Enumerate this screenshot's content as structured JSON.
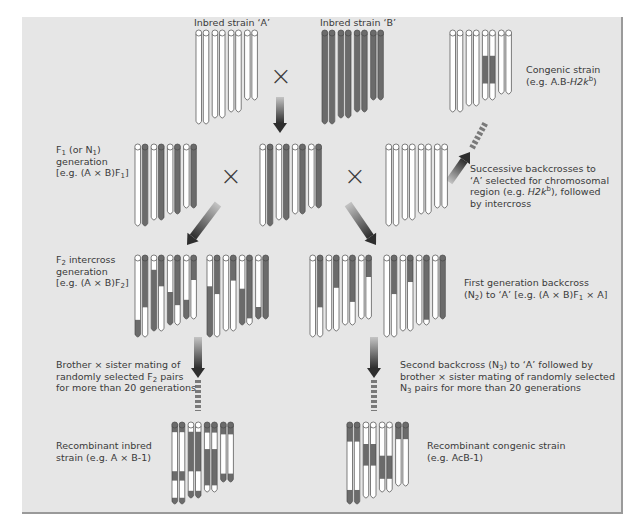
{
  "colors": {
    "panel_bg": "#e6e6e6",
    "panel_border": "#9a9a9a",
    "chrom_A": "#ffffff",
    "chrom_B": "#6b6b6b",
    "outline": "#4a4a4a",
    "text": "#3a3a3a"
  },
  "labels": {
    "inbred_a": "Inbred strain ‘A’",
    "inbred_b": "Inbred strain ‘B’",
    "congenic_line1": "Congenic strain",
    "congenic_line2_pre": "(e.g. A.B-",
    "congenic_line2_gene": "H2k",
    "congenic_line2_sup": "b",
    "congenic_line2_post": ")",
    "f1_line1_pre": "F",
    "f1_line1_sub": "1",
    "f1_line1_mid": " (or N",
    "f1_line1_sub2": "1",
    "f1_line1_post": ")",
    "f1_line2": "generation",
    "f1_line3_pre": "[e.g. (A × B)F",
    "f1_line3_sub": "1",
    "f1_line3_post": "]",
    "successive_line1": "Successive backcrosses to",
    "successive_line2": "‘A’ selected for chromosomal",
    "successive_line3_pre": "region (e.g. ",
    "successive_line3_gene": "H2k",
    "successive_line3_sup": "b",
    "successive_line3_post": "), followed",
    "successive_line4": "by intercross",
    "f2_line1_pre": "F",
    "f2_line1_sub": "2",
    "f2_line1_post": " intercross",
    "f2_line2": "generation",
    "f2_line3_pre": "[e.g. (A × B)F",
    "f2_line3_sub": "2",
    "f2_line3_post": "]",
    "backcross_line1": "First generation backcross",
    "backcross_line2_pre": "(N",
    "backcross_line2_sub": "2",
    "backcross_line2_mid": ") to ‘A’ [e.g. (A × B)F",
    "backcross_line2_sub2": "1",
    "backcross_line2_post": " × A]",
    "bs_left_line1": "Brother × sister mating of",
    "bs_left_line2_pre": "randomly selected F",
    "bs_left_line2_sub": "2",
    "bs_left_line2_post": " pairs",
    "bs_left_line3": "for more than 20 generations",
    "bs_right_line1": "Second backcross (N",
    "bs_right_line1_sub": "3",
    "bs_right_line1_post": ") to ‘A’ followed by",
    "bs_right_line2": "brother × sister mating of randomly selected",
    "bs_right_line3_pre": "N",
    "bs_right_line3_sub": "3",
    "bs_right_line3_post": " pairs for more than 20 generations",
    "ri_line1": "Recombinant inbred",
    "ri_line2": "strain (e.g. A × B-1)",
    "rc_line1": "Recombinant congenic strain",
    "rc_line2": "(e.g. AcB-1)",
    "cross_symbol": "×"
  },
  "chromosome_groups": [
    {
      "name": "inbred-strain-a",
      "x0": 196,
      "top": 31,
      "lengths": [
        90,
        90,
        84,
        84,
        78,
        78,
        66,
        66
      ],
      "segments": [
        [
          "A"
        ],
        [
          "A"
        ],
        [
          "A"
        ],
        [
          "A"
        ],
        [
          "A"
        ],
        [
          "A"
        ],
        [
          "A"
        ],
        [
          "A"
        ]
      ]
    },
    {
      "name": "inbred-strain-b",
      "x0": 322,
      "top": 31,
      "lengths": [
        90,
        90,
        84,
        84,
        78,
        78,
        66,
        66
      ],
      "segments": [
        [
          "B"
        ],
        [
          "B"
        ],
        [
          "B"
        ],
        [
          "B"
        ],
        [
          "B"
        ],
        [
          "B"
        ],
        [
          "B"
        ],
        [
          "B"
        ]
      ]
    },
    {
      "name": "congenic-strain",
      "x0": 450,
      "top": 31,
      "lengths": [
        78,
        78,
        72,
        72,
        66,
        66,
        60,
        60
      ],
      "segments": [
        [
          "A"
        ],
        [
          "A"
        ],
        [
          "A"
        ],
        [
          "A"
        ],
        [
          [
            "A",
            0.33
          ],
          [
            "B",
            0.42
          ],
          [
            "A",
            0.25
          ]
        ],
        [
          [
            "A",
            0.33
          ],
          [
            "B",
            0.42
          ],
          [
            "A",
            0.25
          ]
        ],
        [
          "A"
        ],
        [
          "A"
        ]
      ]
    },
    {
      "name": "f1-generation-left",
      "x0": 135,
      "top": 145,
      "lengths": [
        78,
        78,
        72,
        72,
        66,
        66,
        60,
        60
      ],
      "segments": [
        [
          "A"
        ],
        [
          "B"
        ],
        [
          "A"
        ],
        [
          "B"
        ],
        [
          "A"
        ],
        [
          "B"
        ],
        [
          "A"
        ],
        [
          "B"
        ]
      ]
    },
    {
      "name": "f1-generation-center",
      "x0": 260,
      "top": 145,
      "lengths": [
        78,
        78,
        72,
        72,
        66,
        66,
        60,
        60
      ],
      "segments": [
        [
          "A"
        ],
        [
          "B"
        ],
        [
          "A"
        ],
        [
          "B"
        ],
        [
          "A"
        ],
        [
          "B"
        ],
        [
          "A"
        ],
        [
          "B"
        ]
      ]
    },
    {
      "name": "backcross-parent-a",
      "x0": 386,
      "top": 145,
      "lengths": [
        78,
        78,
        72,
        72,
        66,
        66,
        60,
        60
      ],
      "segments": [
        [
          "A"
        ],
        [
          "A"
        ],
        [
          "A"
        ],
        [
          "A"
        ],
        [
          "A"
        ],
        [
          "A"
        ],
        [
          "A"
        ],
        [
          "A"
        ]
      ]
    },
    {
      "name": "f2-generation-left",
      "x0": 135,
      "top": 256,
      "lengths": [
        78,
        78,
        72,
        72,
        66,
        66,
        60,
        60
      ],
      "segments": [
        [
          [
            "A",
            0.78
          ],
          [
            "B",
            0.22
          ]
        ],
        [
          [
            "B",
            0.62
          ],
          [
            "A",
            0.38
          ]
        ],
        [
          [
            "A",
            0.15
          ],
          [
            "B",
            0.85
          ]
        ],
        [
          [
            "B",
            0.38
          ],
          [
            "A",
            0.62
          ]
        ],
        [
          [
            "A",
            0.5
          ],
          [
            "B",
            0.5
          ]
        ],
        [
          [
            "B",
            0.7
          ],
          [
            "A",
            0.3
          ]
        ],
        [
          [
            "A",
            0.68
          ],
          [
            "B",
            0.32
          ]
        ],
        [
          [
            "B",
            0.35
          ],
          [
            "A",
            0.65
          ]
        ]
      ]
    },
    {
      "name": "f2-generation-right",
      "x0": 207,
      "top": 256,
      "lengths": [
        78,
        78,
        72,
        72,
        66,
        66,
        60,
        60
      ],
      "segments": [
        [
          [
            "A",
            0.35
          ],
          [
            "B",
            0.65
          ]
        ],
        [
          [
            "B",
            0.45
          ],
          [
            "A",
            0.55
          ]
        ],
        [
          [
            "A"
          ]
        ],
        [
          [
            "B",
            0.3
          ],
          [
            "A",
            0.7
          ]
        ],
        [
          [
            "A",
            0.45
          ],
          [
            "B",
            0.55
          ]
        ],
        [
          [
            "B",
            0.9
          ],
          [
            "A",
            0.1
          ]
        ],
        [
          [
            "A",
            0.8
          ],
          [
            "B",
            0.2
          ]
        ],
        [
          [
            "B"
          ]
        ]
      ]
    },
    {
      "name": "n2-backcross-left",
      "x0": 310,
      "top": 256,
      "lengths": [
        78,
        78,
        72,
        72,
        66,
        66,
        60,
        60
      ],
      "segments": [
        [
          [
            "A"
          ]
        ],
        [
          [
            "B",
            0.62
          ],
          [
            "A",
            0.38
          ]
        ],
        [
          [
            "A"
          ]
        ],
        [
          [
            "B",
            0.4
          ],
          [
            "A",
            0.6
          ]
        ],
        [
          [
            "A"
          ]
        ],
        [
          [
            "B",
            0.65
          ],
          [
            "A",
            0.35
          ]
        ],
        [
          [
            "A"
          ]
        ],
        [
          [
            "B",
            0.3
          ],
          [
            "A",
            0.7
          ]
        ]
      ]
    },
    {
      "name": "n2-backcross-right",
      "x0": 384,
      "top": 256,
      "lengths": [
        78,
        78,
        72,
        72,
        66,
        66,
        60,
        60
      ],
      "segments": [
        [
          [
            "A"
          ]
        ],
        [
          [
            "B",
            0.45
          ],
          [
            "A",
            0.55
          ]
        ],
        [
          [
            "A"
          ]
        ],
        [
          [
            "B",
            0.32
          ],
          [
            "A",
            0.68
          ]
        ],
        [
          [
            "A"
          ]
        ],
        [
          [
            "B",
            0.92
          ],
          [
            "A",
            0.08
          ]
        ],
        [
          [
            "A"
          ]
        ],
        [
          [
            "B"
          ]
        ]
      ]
    },
    {
      "name": "recombinant-inbred-strain",
      "x0": 172,
      "top": 423,
      "lengths": [
        78,
        78,
        72,
        72,
        66,
        66,
        56,
        56
      ],
      "segments": [
        [
          [
            "B",
            0.08
          ],
          [
            "A",
            0.5
          ],
          [
            "B",
            0.12
          ],
          [
            "A",
            0.22
          ],
          [
            "B",
            0.08
          ]
        ],
        [
          [
            "B",
            0.08
          ],
          [
            "A",
            0.5
          ],
          [
            "B",
            0.12
          ],
          [
            "A",
            0.22
          ],
          [
            "B",
            0.08
          ]
        ],
        [
          [
            "A",
            0.08
          ],
          [
            "B",
            0.55
          ],
          [
            "A",
            0.27
          ],
          [
            "B",
            0.1
          ]
        ],
        [
          [
            "A",
            0.08
          ],
          [
            "B",
            0.55
          ],
          [
            "A",
            0.27
          ],
          [
            "B",
            0.1
          ]
        ],
        [
          [
            "B",
            0.1
          ],
          [
            "A",
            0.25
          ],
          [
            "B",
            0.55
          ],
          [
            "A",
            0.1
          ]
        ],
        [
          [
            "B",
            0.1
          ],
          [
            "A",
            0.25
          ],
          [
            "B",
            0.55
          ],
          [
            "A",
            0.1
          ]
        ],
        [
          [
            "B",
            0.15
          ],
          [
            "A",
            0.7
          ],
          [
            "B",
            0.15
          ]
        ],
        [
          [
            "B",
            0.15
          ],
          [
            "A",
            0.7
          ],
          [
            "B",
            0.15
          ]
        ]
      ]
    },
    {
      "name": "recombinant-congenic-strain",
      "x0": 347,
      "top": 423,
      "lengths": [
        78,
        78,
        72,
        72,
        66,
        66,
        60,
        60
      ],
      "segments": [
        [
          [
            "B",
            0.2
          ],
          [
            "A",
            0.62
          ],
          [
            "B",
            0.18
          ]
        ],
        [
          [
            "B",
            0.2
          ],
          [
            "A",
            0.62
          ],
          [
            "B",
            0.18
          ]
        ],
        [
          [
            "A",
            0.25
          ],
          [
            "B",
            0.3
          ],
          [
            "A",
            0.45
          ]
        ],
        [
          [
            "A",
            0.25
          ],
          [
            "B",
            0.3
          ],
          [
            "A",
            0.45
          ]
        ],
        [
          [
            "A",
            0.45
          ],
          [
            "B",
            0.35
          ],
          [
            "A",
            0.2
          ]
        ],
        [
          [
            "A",
            0.45
          ],
          [
            "B",
            0.35
          ],
          [
            "A",
            0.2
          ]
        ],
        [
          [
            "B",
            0.22
          ],
          [
            "A",
            0.78
          ]
        ],
        [
          [
            "B",
            0.22
          ],
          [
            "A",
            0.78
          ]
        ]
      ]
    }
  ],
  "arrows": [
    {
      "name": "arrow-parents-to-f1",
      "x1": 280,
      "y1": 97,
      "x2": 280,
      "y2": 133
    },
    {
      "name": "arrow-f1-to-f2",
      "x1": 218,
      "y1": 204,
      "x2": 187,
      "y2": 245
    },
    {
      "name": "arrow-f1-to-backcross",
      "x1": 348,
      "y1": 204,
      "x2": 376,
      "y2": 245
    },
    {
      "name": "arrow-f2-to-ri",
      "x1": 198,
      "y1": 337,
      "x2": 198,
      "y2": 378
    },
    {
      "name": "arrow-n2-to-rc",
      "x1": 374,
      "y1": 337,
      "x2": 374,
      "y2": 378
    },
    {
      "name": "arrow-backcross-to-congenic",
      "x1": 449,
      "y1": 182,
      "x2": 470,
      "y2": 152
    }
  ],
  "dashed_lines": [
    {
      "name": "dashed-ri-generations",
      "x1": 198,
      "y1": 380,
      "x2": 198,
      "y2": 411
    },
    {
      "name": "dashed-rc-generations",
      "x1": 374,
      "y1": 380,
      "x2": 374,
      "y2": 411
    },
    {
      "name": "dashed-congenic-generations",
      "x1": 472,
      "y1": 148,
      "x2": 486,
      "y2": 122
    }
  ]
}
